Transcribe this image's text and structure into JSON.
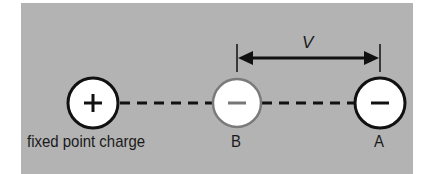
{
  "diagram": {
    "background_color": "#b3b3b3",
    "charges": [
      {
        "id": "fixed",
        "sign": "+",
        "label": "fixed point charge",
        "outline": "#111111"
      },
      {
        "id": "B",
        "sign": "−",
        "label": "B",
        "outline": "#777777"
      },
      {
        "id": "A",
        "sign": "−",
        "label": "A",
        "outline": "#111111"
      }
    ],
    "dimension": {
      "label": "V",
      "from": "B",
      "to": "A"
    },
    "connector": "dashed-line"
  }
}
